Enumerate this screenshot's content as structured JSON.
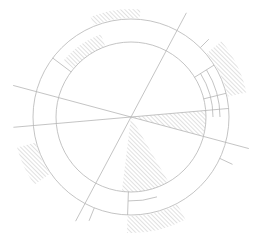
{
  "diagram": {
    "type": "radial-sectioned-circle",
    "stroke_color": "#b5b5b5",
    "hatch_color": "#a8a8a8",
    "background": "#ffffff",
    "center": [
      131,
      117
    ],
    "rings": {
      "inner_radius": 75,
      "outer_radius": 98,
      "right_sub_radii": [
        82,
        89
      ]
    },
    "radial_lines": [
      {
        "angle_deg": -62,
        "r_start": 0,
        "r_end": 118
      },
      {
        "angle_deg": 118,
        "r_start": 0,
        "r_end": 118
      },
      {
        "angle_deg": -165,
        "r_start": 0,
        "r_end": 122
      },
      {
        "angle_deg": 15,
        "r_start": 0,
        "r_end": 122
      },
      {
        "angle_deg": 175,
        "r_start": 0,
        "r_end": 118
      },
      {
        "angle_deg": -5,
        "r_start": 0,
        "r_end": 98
      },
      {
        "angle_deg": -45,
        "r_start": 98,
        "r_end": 110
      },
      {
        "angle_deg": 25,
        "r_start": 98,
        "r_end": 112
      },
      {
        "angle_deg": 112,
        "r_start": 98,
        "r_end": 112
      }
    ],
    "ring_dividers": [
      {
        "angle_deg": -143,
        "r_start": 75,
        "r_end": 98
      },
      {
        "angle_deg": -32,
        "r_start": 75,
        "r_end": 98
      },
      {
        "angle_deg": -14,
        "r_start": 75,
        "r_end": 98
      },
      {
        "angle_deg": 92,
        "r_start": 75,
        "r_end": 98
      }
    ],
    "sub_arcs": [
      {
        "r": 82,
        "start_deg": -32,
        "end_deg": 0
      },
      {
        "r": 89,
        "start_deg": -32,
        "end_deg": 0
      },
      {
        "r": 84,
        "start_deg": 72,
        "end_deg": 92
      }
    ],
    "hatched_regions": [
      {
        "name": "center-wedge-right",
        "kind": "sector",
        "r_in": 0,
        "r_out": 75,
        "start_deg": -5,
        "end_deg": 15
      },
      {
        "name": "center-wedge-bottom",
        "kind": "sector",
        "r_in": 0,
        "r_out": 75,
        "start_deg": 60,
        "end_deg": 97
      },
      {
        "name": "ring-upper-left",
        "kind": "annular",
        "r_in": 75,
        "r_out": 88,
        "start_deg": -140,
        "end_deg": -110
      },
      {
        "name": "outer-top",
        "kind": "annular",
        "r_in": 99,
        "r_out": 108,
        "start_deg": -112,
        "end_deg": -85
      },
      {
        "name": "outer-right",
        "kind": "annular",
        "r_in": 99,
        "r_out": 118,
        "start_deg": -40,
        "end_deg": -12
      },
      {
        "name": "outer-left",
        "kind": "annular",
        "r_in": 99,
        "r_out": 118,
        "start_deg": 145,
        "end_deg": 165
      },
      {
        "name": "outer-bottom",
        "kind": "annular",
        "r_in": 99,
        "r_out": 116,
        "start_deg": 62,
        "end_deg": 92
      }
    ]
  }
}
